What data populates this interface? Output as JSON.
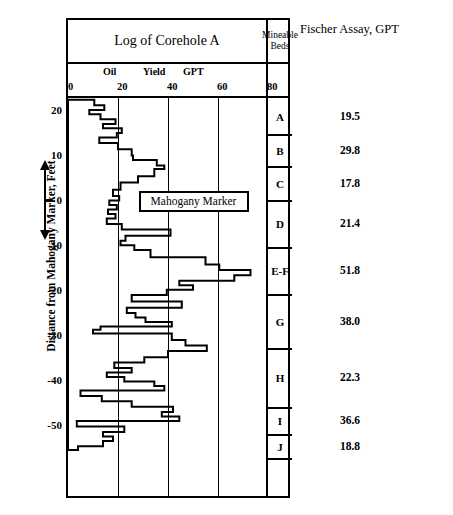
{
  "header": {
    "log_title": "Log of Corehole A",
    "beds_title": "Mineable\nBeds",
    "beds_title_line1": "Mineable",
    "beds_title_line2": "Beds",
    "assay_title": "Fischer Assay, GPT"
  },
  "axis": {
    "x_unit_words": [
      "Oil",
      "Yield",
      "GPT"
    ],
    "x_ticks": [
      0,
      20,
      40,
      60,
      80
    ],
    "x_min": 0,
    "x_max": 80,
    "y_title": "Distance from Mahogany Marker, Feet",
    "y_ticks": [
      20,
      10,
      0,
      -10,
      -20,
      -30,
      -40,
      -50
    ],
    "y_min": -55,
    "y_max": 23
  },
  "annotation": {
    "mahogany_marker": "Mahogany Marker"
  },
  "beds": [
    {
      "label": "A",
      "top_ft": 22.5,
      "bottom_ft": 14.5,
      "assay": "19.5"
    },
    {
      "label": "B",
      "top_ft": 14.5,
      "bottom_ft": 7.5,
      "assay": "29.8"
    },
    {
      "label": "C",
      "top_ft": 7.5,
      "bottom_ft": 0.0,
      "assay": "17.8"
    },
    {
      "label": "D",
      "top_ft": 0.0,
      "bottom_ft": -10.5,
      "assay": "21.4"
    },
    {
      "label": "E-F",
      "top_ft": -10.5,
      "bottom_ft": -21.0,
      "assay": "51.8"
    },
    {
      "label": "G",
      "top_ft": -21.0,
      "bottom_ft": -33.0,
      "assay": "38.0"
    },
    {
      "label": "H",
      "top_ft": -33.0,
      "bottom_ft": -46.0,
      "assay": "22.3"
    },
    {
      "label": "I",
      "top_ft": -46.0,
      "bottom_ft": -52.0,
      "assay": "36.6"
    },
    {
      "label": "J",
      "top_ft": -52.0,
      "bottom_ft": -57.5,
      "assay": "18.8"
    },
    {
      "label": "",
      "top_ft": -57.5,
      "bottom_ft": -62.0,
      "assay": ""
    }
  ],
  "chart_data": {
    "type": "line",
    "title": "Log of Corehole A",
    "xlabel": "Oil Yield GPT",
    "ylabel": "Distance from Mahogany Marker, Feet",
    "xlim": [
      0,
      80
    ],
    "ylim": [
      -55,
      23
    ],
    "grid": true,
    "legend": "none",
    "note": "Step (blocky) oil-shale assay log; each step is an interval of constant oil yield in gallons per ton (GPT) plotted against depth in feet relative to the Mahogany Marker.",
    "series": [
      {
        "name": "Oil Yield GPT",
        "steps": [
          {
            "top_ft": 22.6,
            "bottom_ft": 21.4,
            "gpt": 10.5
          },
          {
            "top_ft": 21.4,
            "bottom_ft": 20.3,
            "gpt": 14.5
          },
          {
            "top_ft": 20.3,
            "bottom_ft": 19.4,
            "gpt": 8.5
          },
          {
            "top_ft": 19.4,
            "bottom_ft": 18.3,
            "gpt": 13.0
          },
          {
            "top_ft": 18.3,
            "bottom_ft": 17.2,
            "gpt": 19.0
          },
          {
            "top_ft": 17.2,
            "bottom_ft": 16.3,
            "gpt": 14.0
          },
          {
            "top_ft": 16.3,
            "bottom_ft": 15.2,
            "gpt": 21.5
          },
          {
            "top_ft": 15.2,
            "bottom_ft": 14.2,
            "gpt": 19.5
          },
          {
            "top_ft": 14.2,
            "bottom_ft": 13.0,
            "gpt": 12.5
          },
          {
            "top_ft": 13.0,
            "bottom_ft": 11.6,
            "gpt": 20.0
          },
          {
            "top_ft": 11.6,
            "bottom_ft": 10.2,
            "gpt": 25.5
          },
          {
            "top_ft": 10.2,
            "bottom_ft": 9.2,
            "gpt": 26.0
          },
          {
            "top_ft": 9.2,
            "bottom_ft": 8.0,
            "gpt": 35.5
          },
          {
            "top_ft": 8.0,
            "bottom_ft": 7.2,
            "gpt": 38.5
          },
          {
            "top_ft": 7.2,
            "bottom_ft": 5.6,
            "gpt": 34.5
          },
          {
            "top_ft": 5.6,
            "bottom_ft": 4.2,
            "gpt": 28.0
          },
          {
            "top_ft": 4.2,
            "bottom_ft": 2.6,
            "gpt": 21.0
          },
          {
            "top_ft": 2.6,
            "bottom_ft": 1.2,
            "gpt": 18.0
          },
          {
            "top_ft": 1.2,
            "bottom_ft": 0.2,
            "gpt": 20.5
          },
          {
            "top_ft": 0.2,
            "bottom_ft": -0.8,
            "gpt": 16.5
          },
          {
            "top_ft": -0.8,
            "bottom_ft": -1.8,
            "gpt": 19.5
          },
          {
            "top_ft": -1.8,
            "bottom_ft": -2.8,
            "gpt": 16.0
          },
          {
            "top_ft": -2.8,
            "bottom_ft": -3.8,
            "gpt": 19.0
          },
          {
            "top_ft": -3.8,
            "bottom_ft": -5.0,
            "gpt": 15.5
          },
          {
            "top_ft": -5.0,
            "bottom_ft": -6.2,
            "gpt": 21.5
          },
          {
            "top_ft": -6.2,
            "bottom_ft": -7.6,
            "gpt": 41.0
          },
          {
            "top_ft": -7.6,
            "bottom_ft": -8.7,
            "gpt": 23.0
          },
          {
            "top_ft": -8.7,
            "bottom_ft": -9.7,
            "gpt": 21.0
          },
          {
            "top_ft": -9.7,
            "bottom_ft": -10.8,
            "gpt": 26.5
          },
          {
            "top_ft": -10.8,
            "bottom_ft": -12.4,
            "gpt": 33.0
          },
          {
            "top_ft": -12.4,
            "bottom_ft": -14.0,
            "gpt": 55.0
          },
          {
            "top_ft": -14.0,
            "bottom_ft": -15.2,
            "gpt": 60.5
          },
          {
            "top_ft": -15.2,
            "bottom_ft": -16.4,
            "gpt": 73.0
          },
          {
            "top_ft": -16.4,
            "bottom_ft": -17.6,
            "gpt": 66.5
          },
          {
            "top_ft": -17.6,
            "bottom_ft": -18.6,
            "gpt": 44.5
          },
          {
            "top_ft": -18.6,
            "bottom_ft": -19.6,
            "gpt": 50.0
          },
          {
            "top_ft": -19.6,
            "bottom_ft": -20.8,
            "gpt": 39.5
          },
          {
            "top_ft": -20.8,
            "bottom_ft": -22.2,
            "gpt": 25.5
          },
          {
            "top_ft": -22.2,
            "bottom_ft": -23.6,
            "gpt": 45.5
          },
          {
            "top_ft": -23.6,
            "bottom_ft": -24.8,
            "gpt": 23.5
          },
          {
            "top_ft": -24.8,
            "bottom_ft": -25.8,
            "gpt": 27.0
          },
          {
            "top_ft": -25.8,
            "bottom_ft": -26.8,
            "gpt": 31.0
          },
          {
            "top_ft": -26.8,
            "bottom_ft": -27.8,
            "gpt": 41.5
          },
          {
            "top_ft": -27.8,
            "bottom_ft": -28.5,
            "gpt": 13.0
          },
          {
            "top_ft": -28.5,
            "bottom_ft": -29.3,
            "gpt": 10.0
          },
          {
            "top_ft": -29.3,
            "bottom_ft": -30.8,
            "gpt": 41.5
          },
          {
            "top_ft": -30.8,
            "bottom_ft": -32.0,
            "gpt": 47.0
          },
          {
            "top_ft": -32.0,
            "bottom_ft": -33.2,
            "gpt": 55.5
          },
          {
            "top_ft": -33.2,
            "bottom_ft": -34.6,
            "gpt": 40.0
          },
          {
            "top_ft": -34.6,
            "bottom_ft": -35.8,
            "gpt": 30.5
          },
          {
            "top_ft": -35.8,
            "bottom_ft": -37.0,
            "gpt": 18.5
          },
          {
            "top_ft": -37.0,
            "bottom_ft": -38.0,
            "gpt": 25.5
          },
          {
            "top_ft": -38.0,
            "bottom_ft": -39.0,
            "gpt": 15.5
          },
          {
            "top_ft": -39.0,
            "bottom_ft": -40.0,
            "gpt": 22.5
          },
          {
            "top_ft": -40.0,
            "bottom_ft": -41.0,
            "gpt": 34.5
          },
          {
            "top_ft": -41.0,
            "bottom_ft": -42.0,
            "gpt": 38.5
          },
          {
            "top_ft": -42.0,
            "bottom_ft": -43.2,
            "gpt": 5.0
          },
          {
            "top_ft": -43.2,
            "bottom_ft": -44.4,
            "gpt": 13.5
          },
          {
            "top_ft": -44.4,
            "bottom_ft": -45.6,
            "gpt": 25.5
          },
          {
            "top_ft": -45.6,
            "bottom_ft": -46.8,
            "gpt": 42.0
          },
          {
            "top_ft": -46.8,
            "bottom_ft": -47.8,
            "gpt": 37.5
          },
          {
            "top_ft": -47.8,
            "bottom_ft": -48.8,
            "gpt": 44.5
          },
          {
            "top_ft": -48.8,
            "bottom_ft": -50.0,
            "gpt": 3.5
          },
          {
            "top_ft": -50.0,
            "bottom_ft": -51.2,
            "gpt": 22.5
          },
          {
            "top_ft": -51.2,
            "bottom_ft": -52.2,
            "gpt": 14.0
          },
          {
            "top_ft": -52.2,
            "bottom_ft": -53.2,
            "gpt": 18.0
          },
          {
            "top_ft": -53.2,
            "bottom_ft": -54.4,
            "gpt": 14.0
          },
          {
            "top_ft": -54.4,
            "bottom_ft": -55.2,
            "gpt": 4.0
          }
        ]
      }
    ]
  }
}
